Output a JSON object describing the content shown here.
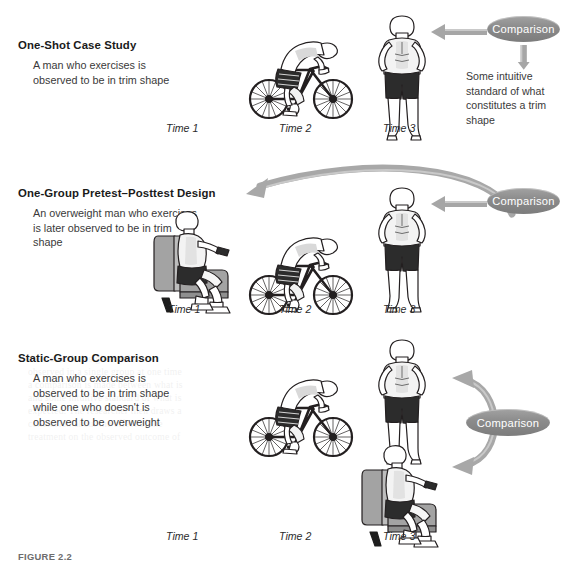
{
  "figure": {
    "caption": "FIGURE 2.2",
    "accent_gray": "#8e8e8e",
    "arrow_gray": "#a6a6a6",
    "ink": "#231f20"
  },
  "panels": [
    {
      "id": "one-shot-case-study",
      "title": "One-Shot Case Study",
      "description": "A man who exercises is observed to be in trim shape",
      "time_labels": [
        "Time 1",
        "Time 2",
        "Time 3"
      ],
      "comparison_label": "Comparison",
      "side_note": "Some intuitive standard of what constitutes a trim shape",
      "figures": [
        "",
        "cyclist",
        "trim-standing-man"
      ]
    },
    {
      "id": "one-group-pretest-posttest-design",
      "title": "One-Group Pretest–Posttest Design",
      "description": "An overweight man who exercises is later observed to be in trim shape",
      "time_labels": [
        "Time 1",
        "Time 2",
        "Time 3"
      ],
      "comparison_label": "Comparison",
      "side_note": "",
      "figures": [
        "overweight-seated-man",
        "cyclist",
        "trim-standing-man"
      ]
    },
    {
      "id": "static-group-comparison",
      "title": "Static-Group Comparison",
      "description": "A man who exercises is observed to be in trim shape while one who doesn't is observed to be overweight",
      "time_labels": [
        "Time 1",
        "Time 2",
        "Time 3"
      ],
      "comparison_label": "Comparison",
      "side_note": "",
      "figures": [
        "",
        "cyclist",
        "trim-standing-man + overweight-seated-man"
      ]
    }
  ],
  "ghost_text": {
    "lines": [
      "the research design  and the",
      "observed in a single group at one time",
      "a comparison is made between what is",
      "and some intuitive standard of what is",
      "expected. The researcher then draws a",
      "conclusion about the effect of the",
      "treatment on the observed outcome of"
    ]
  }
}
